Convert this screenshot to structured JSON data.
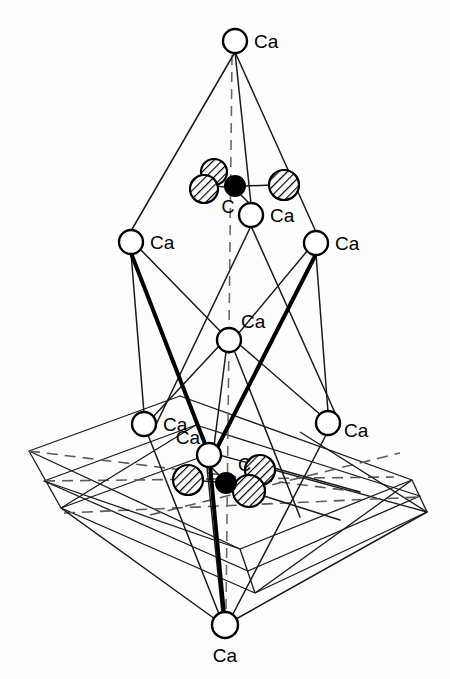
{
  "figure": {
    "background_color": "#fdfdfd",
    "line_color": "#1a1a1a",
    "carbon_color": "#000000",
    "calcium_color": "#ffffff",
    "oxygen_hatch_color": "#000000",
    "labels": {
      "calcium": "Ca",
      "carbon": "C"
    },
    "atoms": [
      {
        "id": "ca-top",
        "species": "Ca",
        "label": "Ca",
        "cx": 235,
        "cy": 41,
        "r": 12,
        "label_x": 254,
        "label_y": 48,
        "anchor": "start"
      },
      {
        "id": "ca-upper-left",
        "species": "Ca",
        "label": "Ca",
        "cx": 131,
        "cy": 242,
        "r": 12,
        "label_x": 150,
        "label_y": 249,
        "anchor": "start"
      },
      {
        "id": "ca-upper-mid",
        "species": "Ca",
        "label": "Ca",
        "cx": 251,
        "cy": 215,
        "r": 12,
        "label_x": 270,
        "label_y": 222,
        "anchor": "start"
      },
      {
        "id": "ca-upper-right",
        "species": "Ca",
        "label": "Ca",
        "cx": 316,
        "cy": 243,
        "r": 12,
        "label_x": 335,
        "label_y": 250,
        "anchor": "start"
      },
      {
        "id": "ca-center",
        "species": "Ca",
        "label": "Ca",
        "cx": 229,
        "cy": 340,
        "r": 12,
        "label_x": 241,
        "label_y": 328,
        "anchor": "start"
      },
      {
        "id": "ca-lower-left",
        "species": "Ca",
        "label": "Ca",
        "cx": 144,
        "cy": 424,
        "r": 12,
        "label_x": 163,
        "label_y": 431,
        "anchor": "start"
      },
      {
        "id": "ca-lower-mid",
        "species": "Ca",
        "label": "Ca",
        "cx": 209,
        "cy": 455,
        "r": 12,
        "label_x": 200,
        "label_y": 444,
        "anchor": "end"
      },
      {
        "id": "ca-lower-right",
        "species": "Ca",
        "label": "Ca",
        "cx": 328,
        "cy": 423,
        "r": 12,
        "label_x": 344,
        "label_y": 437,
        "anchor": "start"
      },
      {
        "id": "ca-bottom",
        "species": "Ca",
        "label": "Ca",
        "cx": 225,
        "cy": 625,
        "r": 13,
        "label_x": 225,
        "label_y": 662,
        "anchor": "middle"
      },
      {
        "id": "c-upper",
        "species": "C",
        "label": "C",
        "cx": 235,
        "cy": 186,
        "r": 10,
        "label_x": 228,
        "label_y": 213,
        "anchor": "middle"
      },
      {
        "id": "c-lower",
        "species": "C",
        "label": "C",
        "cx": 226,
        "cy": 483,
        "r": 10,
        "label_x": 238,
        "label_y": 471,
        "anchor": "start"
      }
    ],
    "oxygens": [
      {
        "id": "o-upper-left-back",
        "cx": 214,
        "cy": 172,
        "r": 13
      },
      {
        "id": "o-upper-left-front",
        "cx": 204,
        "cy": 189,
        "r": 14
      },
      {
        "id": "o-upper-right",
        "cx": 284,
        "cy": 185,
        "r": 15
      },
      {
        "id": "o-lower-left",
        "cx": 188,
        "cy": 480,
        "r": 15
      },
      {
        "id": "o-lower-right-back",
        "cx": 260,
        "cy": 470,
        "r": 15
      },
      {
        "id": "o-lower-right-front",
        "cx": 249,
        "cy": 491,
        "r": 16
      }
    ],
    "counts": {
      "calcium_atoms": 9,
      "carbon_atoms": 2,
      "oxygen_atoms": 6
    }
  }
}
